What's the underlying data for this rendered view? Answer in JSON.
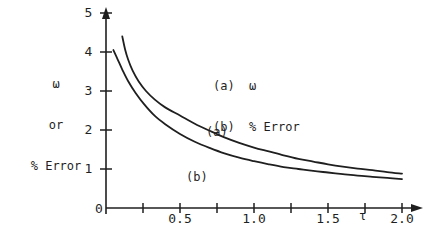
{
  "figure": {
    "background_color": "#ffffff",
    "ink_color": "#1f1f1f"
  },
  "axes": {
    "y_axis_title_lines": [
      "ω",
      "or",
      "% Error"
    ],
    "y_axis_title": "ω or % Error",
    "x_axis_symbol": "τ",
    "origin_label": "0",
    "y_tick_labels": [
      "1",
      "2",
      "3",
      "4",
      "5"
    ],
    "x_tick_labels": [
      "0.5",
      "1.0",
      "1.5",
      "2.0"
    ],
    "y_minor_ticks_per_unit": 1,
    "x_minor_tick_step": 0.25
  },
  "legend": {
    "entries": [
      {
        "key": "(a)",
        "label": "ω"
      },
      {
        "key": "(b)",
        "label": "% Error"
      }
    ],
    "lines": [
      "(a)  ω",
      "(b)  % Error"
    ]
  },
  "curve_labels": {
    "a": "(a)",
    "b": "(b)"
  },
  "chart_data": {
    "type": "line",
    "title": "",
    "xlabel": "τ",
    "ylabel": "ω or % Error",
    "xlim": [
      0,
      2.1
    ],
    "ylim": [
      0,
      5.2
    ],
    "xticks": [
      0,
      0.5,
      1.0,
      1.5,
      2.0
    ],
    "xtick_labels": [
      "0",
      "0.5",
      "1.0",
      "1.5",
      "2.0"
    ],
    "yticks": [
      0,
      1,
      2,
      3,
      4,
      5
    ],
    "ytick_labels": [
      "0",
      "1",
      "2",
      "3",
      "4",
      "5"
    ],
    "grid": false,
    "legend_position": "upper-center-inside",
    "series": [
      {
        "name": "(a) ω",
        "label": "(a)",
        "x": [
          0.11,
          0.13,
          0.15,
          0.18,
          0.22,
          0.27,
          0.33,
          0.4,
          0.5,
          0.6,
          0.7,
          0.8,
          0.9,
          1.0,
          1.1,
          1.2,
          1.3,
          1.4,
          1.5,
          1.6,
          1.7,
          1.8,
          1.9,
          2.0
        ],
        "y": [
          4.4,
          4.05,
          3.8,
          3.52,
          3.25,
          3.0,
          2.78,
          2.58,
          2.37,
          2.16,
          1.98,
          1.81,
          1.67,
          1.55,
          1.45,
          1.35,
          1.26,
          1.19,
          1.12,
          1.06,
          1.01,
          0.97,
          0.92,
          0.88
        ]
      },
      {
        "name": "(b) % Error",
        "label": "(b)",
        "x": [
          0.05,
          0.08,
          0.11,
          0.15,
          0.2,
          0.26,
          0.33,
          0.4,
          0.5,
          0.6,
          0.7,
          0.8,
          0.9,
          1.0,
          1.1,
          1.2,
          1.3,
          1.4,
          1.5,
          1.6,
          1.7,
          1.8,
          1.9,
          2.0
        ],
        "y": [
          4.05,
          3.8,
          3.55,
          3.25,
          2.95,
          2.65,
          2.36,
          2.15,
          1.9,
          1.7,
          1.54,
          1.4,
          1.29,
          1.2,
          1.12,
          1.05,
          1.0,
          0.95,
          0.91,
          0.87,
          0.83,
          0.8,
          0.77,
          0.74
        ]
      }
    ]
  }
}
